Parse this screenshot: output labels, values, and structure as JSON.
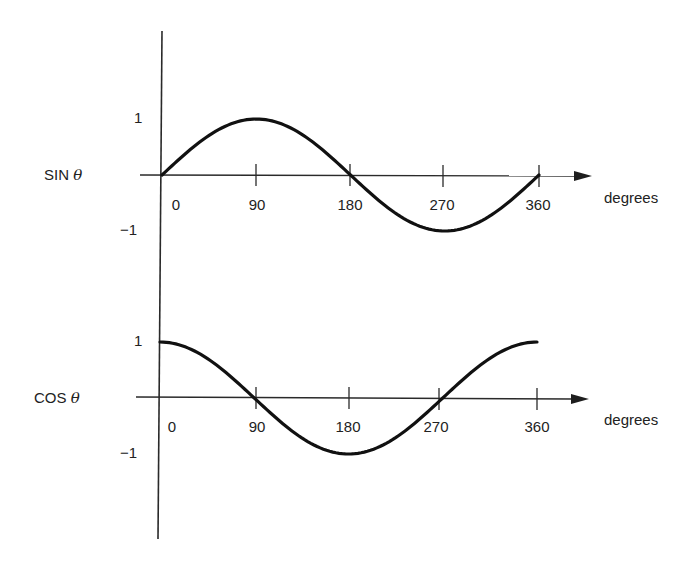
{
  "chart_data": [
    {
      "type": "line",
      "title": "",
      "series_label": "SIN θ",
      "xlabel": "degrees",
      "ylabel": "SIN θ",
      "x": [
        0,
        45,
        90,
        135,
        180,
        225,
        270,
        315,
        360
      ],
      "series": [
        {
          "name": "sin θ",
          "values": [
            0,
            0.707,
            1,
            0.707,
            0,
            -0.707,
            -1,
            -0.707,
            0
          ]
        }
      ],
      "xticks": [
        "0",
        "90",
        "180",
        "270",
        "360"
      ],
      "yticks": [
        "1",
        "−1"
      ],
      "xlim": [
        0,
        360
      ],
      "ylim": [
        -1,
        1
      ],
      "grid": false,
      "legend": "none"
    },
    {
      "type": "line",
      "title": "",
      "series_label": "COS θ",
      "xlabel": "degrees",
      "ylabel": "COS θ",
      "x": [
        0,
        45,
        90,
        135,
        180,
        225,
        270,
        315,
        360
      ],
      "series": [
        {
          "name": "cos θ",
          "values": [
            1,
            0.707,
            0,
            -0.707,
            -1,
            -0.707,
            0,
            0.707,
            1
          ]
        }
      ],
      "xticks": [
        "0",
        "90",
        "180",
        "270",
        "360"
      ],
      "yticks": [
        "1",
        "−1"
      ],
      "xlim": [
        0,
        360
      ],
      "ylim": [
        -1,
        1
      ],
      "grid": false,
      "legend": "none"
    }
  ],
  "labels": {
    "sin": {
      "name": "SIN",
      "symbol": "θ"
    },
    "cos": {
      "name": "COS",
      "symbol": "θ"
    },
    "xaxis_unit": "degrees",
    "y_pos": "1",
    "y_neg": "−1",
    "ticks": [
      "0",
      "90",
      "180",
      "270",
      "360"
    ]
  },
  "colors": {
    "line": "#111111",
    "axis": "#2a2a2a",
    "background": "#ffffff"
  }
}
